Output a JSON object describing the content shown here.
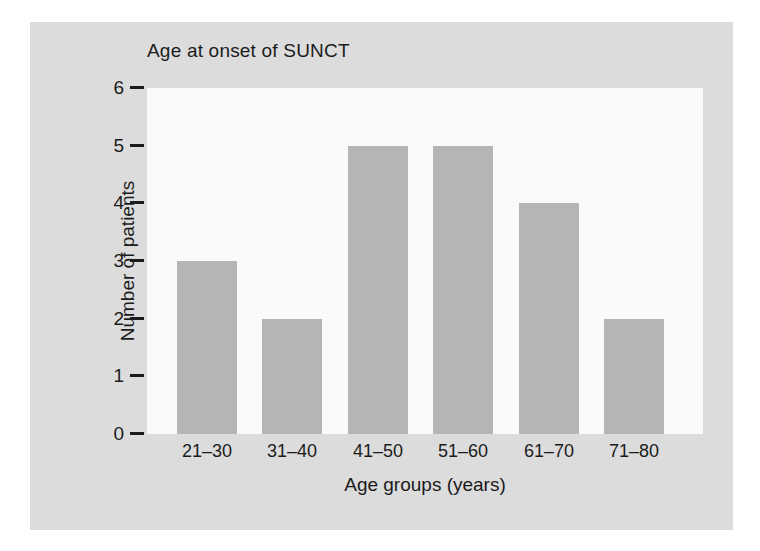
{
  "chart_data": {
    "type": "bar",
    "title": "Age at onset of SUNCT",
    "xlabel": "Age groups (years)",
    "ylabel": "Number of patients",
    "categories": [
      "21–30",
      "31–40",
      "41–50",
      "51–60",
      "61–70",
      "71–80"
    ],
    "values": [
      3,
      2,
      5,
      5,
      4,
      2
    ],
    "ylim": [
      0,
      6
    ],
    "yticks": [
      "0",
      "1",
      "2",
      "3",
      "4",
      "5",
      "6"
    ],
    "grid": false,
    "legend": null,
    "colors": {
      "bar": "#b5b5b5",
      "plot_background": "#fafafa",
      "figure_background": "#dcdcdc",
      "text": "#1b1b1b"
    }
  }
}
